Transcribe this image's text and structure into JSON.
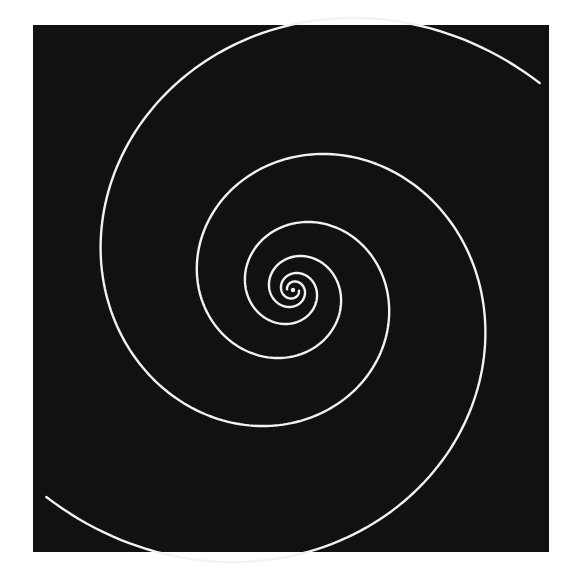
{
  "image": {
    "description": "Two-armed logarithmic spiral drawn in white on a black square",
    "background_color": "#ffffff",
    "panel": {
      "x": 33,
      "y": 25,
      "width": 516,
      "height": 527,
      "color": "#111111"
    },
    "stroke_color": "#f2f2f2",
    "spiral": {
      "center": {
        "x": 293,
        "y": 290
      },
      "arms": 2,
      "growth_per_half_turn": 2.0,
      "arm_a": {
        "end_angle_deg": -40,
        "end_radius": 322
      },
      "arm_b": {
        "end_angle_deg": 140,
        "end_radius": 322
      },
      "inner_radius": 6
    },
    "center_dot": {
      "x": 293,
      "y": 290,
      "r": 2.2
    }
  }
}
